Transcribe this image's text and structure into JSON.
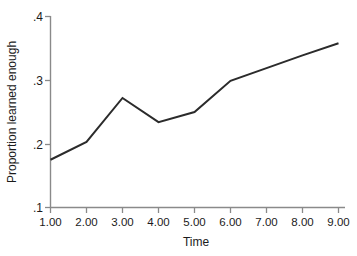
{
  "chart_data": {
    "type": "line",
    "title": "",
    "xlabel": "Time",
    "ylabel": "Proportion learned enough",
    "x": [
      1,
      2,
      3,
      4,
      5,
      6,
      7,
      8,
      9
    ],
    "values": [
      0.175,
      0.203,
      0.272,
      0.234,
      0.25,
      0.299,
      0.319,
      0.339,
      0.358
    ],
    "xticklabels": [
      "1.00",
      "2.00",
      "3.00",
      "4.00",
      "5.00",
      "6.00",
      "7.00",
      "8.00",
      "9.00"
    ],
    "yticklabels": [
      ".4",
      ".3",
      ".2",
      ".1"
    ],
    "ytickvalues": [
      0.4,
      0.3,
      0.2,
      0.1
    ],
    "xlim": [
      1,
      9
    ],
    "ylim": [
      0.1,
      0.4
    ],
    "grid": false,
    "legend": false,
    "line_color": "#2b2b2b",
    "axis_color": "#8a8a8a",
    "background_color": "#ffffff"
  },
  "axes": {
    "y_title": "Proportion learned enough",
    "x_title": "Time"
  }
}
